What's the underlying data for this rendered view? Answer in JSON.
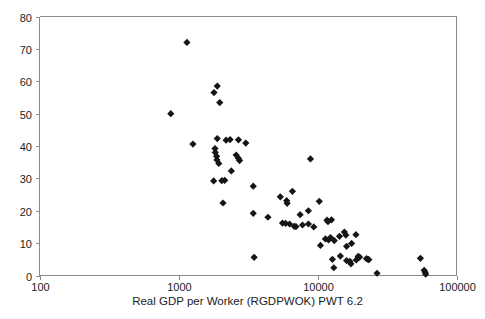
{
  "chart_data": {
    "type": "scatter",
    "title": "",
    "xlabel": "Real GDP per Worker (RGDPWOK) PWT 6.2",
    "ylabel": "",
    "xscale": "log",
    "yscale": "linear",
    "xlim": [
      100,
      100000
    ],
    "ylim": [
      0,
      80
    ],
    "grid": false,
    "legend": null,
    "xticks": [
      100,
      1000,
      10000,
      100000
    ],
    "xtick_labels": [
      "100",
      "1000",
      "10000",
      "100000"
    ],
    "yticks": [
      0,
      10,
      20,
      30,
      40,
      50,
      60,
      70,
      80
    ],
    "ytick_labels": [
      "0",
      "10",
      "20",
      "30",
      "40",
      "50",
      "60",
      "70",
      "80"
    ],
    "marker": {
      "shape": "diamond",
      "color": "#151515",
      "size": 3.6
    },
    "series": [
      {
        "name": "countries",
        "points": [
          [
            1150,
            72.0
          ],
          [
            880,
            50.0
          ],
          [
            1800,
            56.5
          ],
          [
            1900,
            58.5
          ],
          [
            1980,
            53.4
          ],
          [
            1270,
            40.6
          ],
          [
            1900,
            42.3
          ],
          [
            2200,
            41.8
          ],
          [
            2700,
            41.9
          ],
          [
            3050,
            40.9
          ],
          [
            1830,
            39.2
          ],
          [
            1840,
            38.0
          ],
          [
            1880,
            36.8
          ],
          [
            1890,
            35.7
          ],
          [
            1950,
            34.6
          ],
          [
            2600,
            37.2
          ],
          [
            2700,
            36.2
          ],
          [
            2750,
            35.5
          ],
          [
            2400,
            32.3
          ],
          [
            1790,
            29.2
          ],
          [
            2050,
            29.3
          ],
          [
            2150,
            29.4
          ],
          [
            3450,
            27.6
          ],
          [
            2090,
            22.4
          ],
          [
            3500,
            5.6
          ],
          [
            3450,
            19.2
          ],
          [
            4400,
            18.0
          ],
          [
            5400,
            24.3
          ],
          [
            6000,
            23.1
          ],
          [
            6050,
            22.3
          ],
          [
            6600,
            26.0
          ],
          [
            8900,
            36.0
          ],
          [
            7500,
            18.8
          ],
          [
            8600,
            20.0
          ],
          [
            10300,
            22.9
          ],
          [
            5900,
            16.1
          ],
          [
            6300,
            15.9
          ],
          [
            6800,
            15.2
          ],
          [
            7000,
            15.1
          ],
          [
            7800,
            15.6
          ],
          [
            8600,
            15.9
          ],
          [
            11700,
            17.1
          ],
          [
            11900,
            16.6
          ],
          [
            12600,
            17.2
          ],
          [
            10500,
            9.3
          ],
          [
            11400,
            11.3
          ],
          [
            12000,
            11.0
          ],
          [
            12400,
            11.7
          ],
          [
            13200,
            10.8
          ],
          [
            14400,
            12.1
          ],
          [
            15600,
            13.4
          ],
          [
            16000,
            12.5
          ],
          [
            16200,
            9.0
          ],
          [
            17600,
            9.9
          ],
          [
            18900,
            12.6
          ],
          [
            14600,
            6.0
          ],
          [
            16200,
            4.6
          ],
          [
            17100,
            4.4
          ],
          [
            17400,
            3.6
          ],
          [
            19600,
            5.9
          ],
          [
            20100,
            5.7
          ],
          [
            22500,
            5.2
          ],
          [
            23100,
            5.0
          ],
          [
            23400,
            4.9
          ],
          [
            13100,
            2.4
          ],
          [
            26800,
            0.7
          ],
          [
            55000,
            5.3
          ],
          [
            58500,
            1.6
          ],
          [
            59500,
            1.0
          ],
          [
            60000,
            0.4
          ],
          [
            12800,
            5.0
          ],
          [
            9400,
            15.0
          ],
          [
            5600,
            16.2
          ],
          [
            19000,
            4.8
          ],
          [
            2350,
            42.0
          ]
        ]
      }
    ]
  },
  "axis": {
    "x_title": "Real GDP per Worker (RGDPWOK) PWT 6.2"
  }
}
